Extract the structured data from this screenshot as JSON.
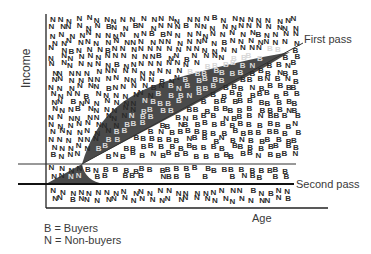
{
  "diagram": {
    "y_axis_label": "Income",
    "x_axis_label": "Age",
    "lines": {
      "first_pass": "First pass",
      "second_pass": "Second pass"
    },
    "legend": [
      {
        "symbol": "B",
        "text": "B = Buyers"
      },
      {
        "symbol": "N",
        "text": "N = Non-buyers"
      }
    ],
    "colors": {
      "shaded_region": "#4a4a4a",
      "axis": "#222222",
      "text": "#3a3a3a",
      "marker_dark": "#2b2b2b",
      "marker_light": "#d8d8d8"
    }
  }
}
